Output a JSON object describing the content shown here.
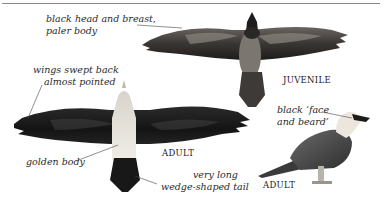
{
  "figure": {
    "birds": [
      {
        "id": "juvenile-flight",
        "caption": "JUVENILE",
        "annotations": [
          "black head and breast,",
          "paler body"
        ]
      },
      {
        "id": "adult-flight",
        "caption": "ADULT",
        "annotations": [
          [
            "wings swept back",
            "almost pointed"
          ],
          [
            "golden body"
          ],
          [
            "very long",
            "wedge-shaped tail"
          ]
        ]
      },
      {
        "id": "adult-perched",
        "caption": "ADULT",
        "annotations": [
          "black ‘face",
          "and beard’"
        ]
      }
    ]
  },
  "labels": {
    "juvenile_note_line1": "black head and breast,",
    "juvenile_note_line2": "paler body",
    "juvenile_caption": "JUVENILE",
    "wings_note_line1": "wings swept back",
    "wings_note_line2": "almost pointed",
    "body_note": "golden body",
    "adult_flight_caption": "ADULT",
    "tail_note_line1": "very long",
    "tail_note_line2": "wedge-shaped tail",
    "face_note_line1": "black ‘face",
    "face_note_line2": "and beard’",
    "adult_perched_caption": "ADULT"
  },
  "colors": {
    "rule": "#8a8a8a",
    "text": "#2a2a2a",
    "wing_dark": "#1c1c1c",
    "juvenile_mid": "#5a5450",
    "adult_body": "#e6e2d8",
    "perched_body": "#4a4a4a"
  }
}
